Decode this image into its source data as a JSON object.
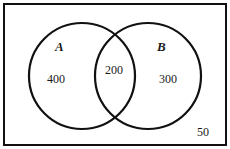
{
  "diagram": {
    "type": "venn",
    "universe_region": {
      "label": "",
      "outside_count": "50"
    },
    "sets": [
      {
        "name": "A",
        "only_count": "400"
      },
      {
        "name": "B",
        "only_count": "300"
      }
    ],
    "intersection": {
      "sets": [
        "A",
        "B"
      ],
      "count": "200"
    },
    "colors": {
      "stroke": "#111111",
      "text": "#1a1a1a",
      "background": "#ffffff"
    }
  }
}
